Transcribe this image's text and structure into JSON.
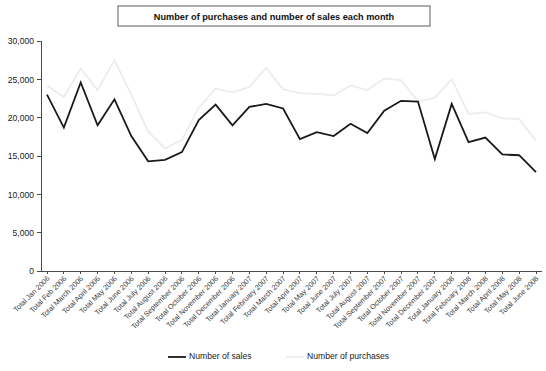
{
  "chart_data": {
    "type": "line",
    "title": "Number of purchases and number of sales each month",
    "xlabel": "",
    "ylabel": "",
    "ylim": [
      0,
      30000
    ],
    "ytick_labels": [
      "0",
      "5,000",
      "10,000",
      "15,000",
      "20,000",
      "25,000",
      "30,000"
    ],
    "ytick_values": [
      0,
      5000,
      10000,
      15000,
      20000,
      25000,
      30000
    ],
    "grid": false,
    "legend_position": "bottom",
    "categories": [
      "Total Jan 2006",
      "Total Feb 2006",
      "Total March 2006",
      "Total April 2006",
      "Total May 2006",
      "Total June 2006",
      "Total July 2006",
      "Total August 2006",
      "Total September 2006",
      "Total October 2006",
      "Total November 2006",
      "Total December 2006",
      "Total January 2007",
      "Total February 2007",
      "Total March 2007",
      "Total April 2007",
      "Total May 2007",
      "Total June 2007",
      "Total July 2007",
      "Total August 2007",
      "Total September 2007",
      "Total October 2007",
      "Total November 2007",
      "Total December 2007",
      "Total January 2008",
      "Total February 2008",
      "Total March 2008",
      "Total April 2008",
      "Total May 2008",
      "Total June 2008"
    ],
    "series": [
      {
        "name": "Number of sales",
        "color": "#1a1a1a",
        "width": 1.8,
        "values": [
          23000,
          18700,
          24600,
          19000,
          22400,
          17600,
          14300,
          14500,
          15500,
          19700,
          21700,
          19000,
          21400,
          21800,
          21200,
          17200,
          18100,
          17600,
          19200,
          18000,
          20900,
          22200,
          22100,
          14600,
          21800,
          16800,
          17400,
          15200,
          15100,
          12900
        ]
      },
      {
        "name": "Number of purchases",
        "color": "#ececec",
        "width": 1.8,
        "values": [
          24200,
          22700,
          26400,
          23600,
          27500,
          23000,
          18200,
          16000,
          17100,
          21300,
          23800,
          23300,
          24000,
          26500,
          23700,
          23200,
          23100,
          22900,
          24200,
          23600,
          25100,
          24900,
          22100,
          22600,
          25000,
          20500,
          20700,
          19900,
          19800,
          17000
        ]
      }
    ]
  },
  "legend": {
    "items": [
      {
        "label": "Number of sales",
        "color": "#1a1a1a"
      },
      {
        "label": "Number of purchases",
        "color": "#ececec"
      }
    ]
  }
}
